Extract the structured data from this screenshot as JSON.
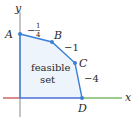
{
  "diagram": {
    "axes": {
      "x_label": "x",
      "y_label": "y",
      "colors": {
        "x_negative": "#c0504d",
        "x_feasible": "#4a6fd4",
        "x_positive": "#7cb86a",
        "y_axis": "#8a8a8a"
      }
    },
    "region": {
      "label_line1": "feasible",
      "label_line2": "set",
      "fill": "#eef4fb",
      "edge_color": "#3b7fd6"
    },
    "vertices": [
      {
        "name": "A"
      },
      {
        "name": "B"
      },
      {
        "name": "C"
      },
      {
        "name": "D"
      }
    ],
    "edge_slopes": {
      "AB_num": "1",
      "AB_den": "4",
      "AB_sign": "−",
      "BC": "−1",
      "CD": "−4"
    }
  }
}
